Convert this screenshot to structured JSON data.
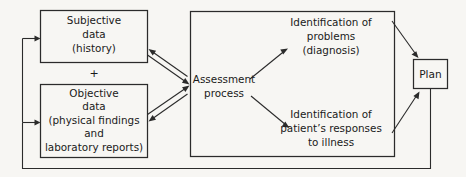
{
  "figure": {
    "kind": "flow-diagram",
    "title_visible": false,
    "background_color": "#f7f6f3",
    "ink_color": "#2b2b2b"
  },
  "nodes": {
    "subjective": {
      "name": "Subjective data",
      "lines": [
        "Subjective",
        "data",
        "(history)"
      ]
    },
    "plus": {
      "symbol": "+"
    },
    "objective": {
      "name": "Objective data",
      "lines": [
        "Objective",
        "data",
        "(physical findings",
        "and",
        "laboratory reports)"
      ]
    },
    "assessment": {
      "name": "Assessment process",
      "lines": [
        "Assessment",
        "process"
      ]
    },
    "problems": {
      "name": "Identification of problems",
      "lines": [
        "Identification of",
        "problems",
        "(diagnosis)"
      ]
    },
    "responses": {
      "name": "Identification of patient's responses to illness",
      "lines": [
        "Identification of",
        "patient’s responses",
        "to illness"
      ]
    },
    "plan": {
      "name": "Plan",
      "lines": [
        "Plan"
      ]
    }
  },
  "edges": [
    {
      "id": "subjective-to-assessment",
      "from": "subjective",
      "to": "assessment",
      "style": "double-line-bidirectional"
    },
    {
      "id": "objective-to-assessment",
      "from": "objective",
      "to": "assessment",
      "style": "double-line-bidirectional"
    },
    {
      "id": "assessment-to-problems",
      "from": "assessment",
      "to": "problems",
      "style": "single-arrow"
    },
    {
      "id": "assessment-to-responses",
      "from": "assessment",
      "to": "responses",
      "style": "single-arrow"
    },
    {
      "id": "problems-to-plan",
      "from": "problems",
      "to": "plan",
      "style": "single-arrow"
    },
    {
      "id": "responses-to-plan",
      "from": "responses",
      "to": "plan",
      "style": "single-arrow"
    },
    {
      "id": "plan-feedback-to-subjective",
      "from": "plan",
      "to": "subjective",
      "style": "feedback-loop-arrow"
    },
    {
      "id": "plan-feedback-to-objective",
      "from": "plan",
      "to": "objective",
      "style": "feedback-loop-arrow"
    }
  ]
}
